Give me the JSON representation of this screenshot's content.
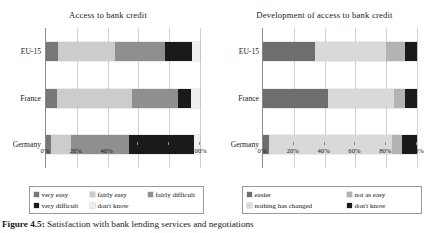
{
  "caption": {
    "label": "Figure 4.5:",
    "text": "Satisfaction with bank lending services and negotiations"
  },
  "charts": [
    {
      "id": "access-to-bank-credit",
      "title": "Access to bank credit",
      "categories": [
        "EU-15",
        "France",
        "Germany"
      ],
      "xticks": [
        "0%",
        "20%",
        "40%",
        "60%",
        "80%",
        "100%"
      ],
      "xlim": [
        0,
        100
      ],
      "legend": [
        {
          "label": "very easy",
          "color": "#777777"
        },
        {
          "label": "fairly easy",
          "color": "#cccccc"
        },
        {
          "label": "fairly difficult",
          "color": "#8f8f8f"
        },
        {
          "label": "very difficult",
          "color": "#1a1a1a"
        },
        {
          "label": "don't know",
          "color": "#efefef"
        }
      ],
      "series": [
        {
          "name": "very easy",
          "color": "#777777",
          "values": [
            8,
            7,
            3
          ]
        },
        {
          "name": "fairly easy",
          "color": "#cccccc",
          "values": [
            37,
            49,
            13
          ]
        },
        {
          "name": "fairly difficult",
          "color": "#8f8f8f",
          "values": [
            32,
            30,
            38
          ]
        },
        {
          "name": "very difficult",
          "color": "#1a1a1a",
          "values": [
            18,
            8,
            42
          ]
        },
        {
          "name": "don't know",
          "color": "#efefef",
          "values": [
            5,
            6,
            4
          ]
        }
      ]
    },
    {
      "id": "development-of-access-to-bank-credit",
      "title": "Development of access to bank credit",
      "categories": [
        "EU-15",
        "France",
        "Germany"
      ],
      "xticks": [
        "0%",
        "20%",
        "40%",
        "60%",
        "80%",
        "100%"
      ],
      "xlim": [
        0,
        100
      ],
      "legend": [
        {
          "label": "easier",
          "color": "#6e6e6e"
        },
        {
          "label": "not as easy",
          "color": "#b3b3b3"
        },
        {
          "label": "nothing has changed",
          "color": "#d9d9d9"
        },
        {
          "label": "don't know",
          "color": "#1a1a1a"
        }
      ],
      "series": [
        {
          "name": "easier",
          "color": "#6e6e6e",
          "values": [
            34,
            42,
            4
          ]
        },
        {
          "name": "nothing has changed",
          "color": "#d9d9d9",
          "values": [
            46,
            43,
            80
          ]
        },
        {
          "name": "not as easy",
          "color": "#b3b3b3",
          "values": [
            12,
            7,
            6
          ]
        },
        {
          "name": "don't know",
          "color": "#1a1a1a",
          "values": [
            8,
            8,
            10
          ]
        }
      ]
    }
  ],
  "chart_data": {
    "type": "bar",
    "orientation": "horizontal",
    "stacked": true,
    "normalized_percent": true,
    "grid": "vertical",
    "legend_position": "bottom",
    "panels": [
      {
        "title": "Access to bank credit",
        "xlabel": "",
        "ylabel": "",
        "xlim": [
          0,
          100
        ],
        "xticks": [
          0,
          20,
          40,
          60,
          80,
          100
        ],
        "xticklabels": [
          "0%",
          "20%",
          "40%",
          "60%",
          "80%",
          "100%"
        ],
        "categories": [
          "EU-15",
          "France",
          "Germany"
        ],
        "series": [
          {
            "name": "very easy",
            "values": [
              8,
              7,
              3
            ],
            "color": "#777777"
          },
          {
            "name": "fairly easy",
            "values": [
              37,
              49,
              13
            ],
            "color": "#cccccc"
          },
          {
            "name": "fairly difficult",
            "values": [
              32,
              30,
              38
            ],
            "color": "#8f8f8f"
          },
          {
            "name": "very difficult",
            "values": [
              18,
              8,
              42
            ],
            "color": "#1a1a1a"
          },
          {
            "name": "don't know",
            "values": [
              5,
              6,
              4
            ],
            "color": "#efefef"
          }
        ]
      },
      {
        "title": "Development of access to bank credit",
        "xlabel": "",
        "ylabel": "",
        "xlim": [
          0,
          100
        ],
        "xticks": [
          0,
          20,
          40,
          60,
          80,
          100
        ],
        "xticklabels": [
          "0%",
          "20%",
          "40%",
          "60%",
          "80%",
          "100%"
        ],
        "categories": [
          "EU-15",
          "France",
          "Germany"
        ],
        "series": [
          {
            "name": "easier",
            "values": [
              34,
              42,
              4
            ],
            "color": "#6e6e6e"
          },
          {
            "name": "nothing has changed",
            "values": [
              46,
              43,
              80
            ],
            "color": "#d9d9d9"
          },
          {
            "name": "not as easy",
            "values": [
              12,
              7,
              6
            ],
            "color": "#b3b3b3"
          },
          {
            "name": "don't know",
            "values": [
              8,
              8,
              10
            ],
            "color": "#1a1a1a"
          }
        ]
      }
    ]
  }
}
